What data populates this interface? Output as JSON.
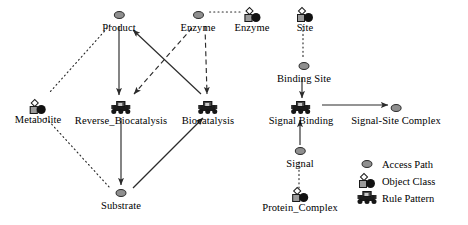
{
  "diagram": {
    "nodes": [
      {
        "id": "product",
        "label": "Product",
        "kind": "access-path",
        "x": 119,
        "y": 8
      },
      {
        "id": "enzyme_access",
        "label": "Enzyme",
        "kind": "access-path",
        "x": 198,
        "y": 8
      },
      {
        "id": "enzyme_class",
        "label": "Enzyme",
        "kind": "object-class",
        "x": 252,
        "y": 8
      },
      {
        "id": "site_class",
        "label": "Site",
        "kind": "object-class",
        "x": 305,
        "y": 8
      },
      {
        "id": "metabolite",
        "label": "Metabolite",
        "kind": "object-class",
        "x": 38,
        "y": 103
      },
      {
        "id": "reverse_biocatalysis",
        "label": "Reverse_Biocatalysis",
        "kind": "rule-pattern",
        "x": 121,
        "y": 103
      },
      {
        "id": "biocatalysis",
        "label": "Biocatalysis",
        "kind": "rule-pattern",
        "x": 208,
        "y": 103
      },
      {
        "id": "substrate",
        "label": "Substrate",
        "kind": "access-path",
        "x": 121,
        "y": 191
      },
      {
        "id": "binding_site",
        "label": "Binding Site",
        "kind": "access-path",
        "x": 305,
        "y": 62
      },
      {
        "id": "signal_binding",
        "label": "Signal Binding",
        "kind": "rule-pattern",
        "x": 300,
        "y": 104
      },
      {
        "id": "signal_site_complex",
        "label": "Signal-Site Complex",
        "kind": "access-path",
        "x": 396,
        "y": 104
      },
      {
        "id": "signal",
        "label": "Signal",
        "kind": "access-path",
        "x": 300,
        "y": 147
      },
      {
        "id": "protein_complex",
        "label": "Protein_Complex",
        "kind": "object-class",
        "x": 300,
        "y": 191
      }
    ],
    "edges": [
      {
        "from": "product",
        "to": "metabolite",
        "style": "dotted",
        "arrow": false
      },
      {
        "from": "metabolite",
        "to": "substrate",
        "style": "dotted",
        "arrow": false
      },
      {
        "from": "product",
        "to": "reverse_biocatalysis",
        "style": "solid",
        "arrow": true
      },
      {
        "from": "biocatalysis",
        "to": "product",
        "style": "solid",
        "arrow": true
      },
      {
        "from": "enzyme_access",
        "to": "reverse_biocatalysis",
        "style": "dashed",
        "arrow": true
      },
      {
        "from": "enzyme_access",
        "to": "biocatalysis",
        "style": "dashed",
        "arrow": true
      },
      {
        "from": "enzyme_class",
        "to": "enzyme_access",
        "style": "dotted",
        "arrow": false
      },
      {
        "from": "reverse_biocatalysis",
        "to": "substrate",
        "style": "solid",
        "arrow": true
      },
      {
        "from": "substrate",
        "to": "biocatalysis",
        "style": "solid",
        "arrow": true
      },
      {
        "from": "site_class",
        "to": "binding_site",
        "style": "dotted",
        "arrow": false
      },
      {
        "from": "binding_site",
        "to": "signal_binding",
        "style": "solid",
        "arrow": true
      },
      {
        "from": "signal_binding",
        "to": "signal_site_complex",
        "style": "solid",
        "arrow": true
      },
      {
        "from": "signal",
        "to": "signal_binding",
        "style": "solid",
        "arrow": true
      },
      {
        "from": "protein_complex",
        "to": "signal",
        "style": "dotted",
        "arrow": false
      }
    ]
  },
  "legend": {
    "items": [
      {
        "icon": "access-path-icon",
        "label": "Access Path"
      },
      {
        "icon": "object-class-icon",
        "label": "Object Class"
      },
      {
        "icon": "rule-pattern-icon",
        "label": "Rule Pattern"
      }
    ]
  },
  "colors": {
    "access_path_fill": "#8f8f8f",
    "object_class_square": "#9a9a9a",
    "object_class_circle": "#111111",
    "rule_pattern": "#1c1c1c",
    "edge": "#2b2b2b",
    "background": "#ffffff"
  }
}
